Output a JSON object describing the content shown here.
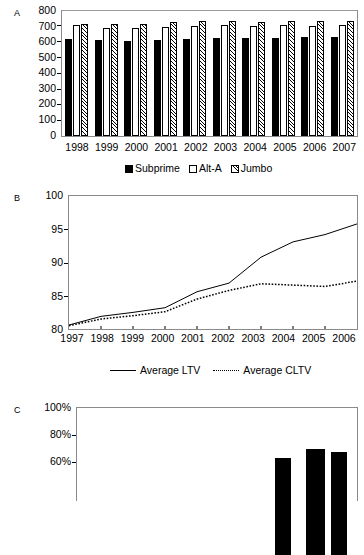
{
  "figure": {
    "panels": [
      {
        "letter": "A"
      },
      {
        "letter": "B"
      },
      {
        "letter": "C"
      }
    ]
  },
  "panelA": {
    "letter": "A",
    "yticks": [
      "800",
      "700",
      "600",
      "500",
      "400",
      "300",
      "200",
      "100",
      "0"
    ],
    "xticks": [
      "1998",
      "1999",
      "2000",
      "2001",
      "2002",
      "2003",
      "2004",
      "2005",
      "2006",
      "2007"
    ],
    "legend": [
      {
        "label": "Subprime",
        "swatch": "solid-square-icon"
      },
      {
        "label": "Alt-A",
        "swatch": "open-square-icon"
      },
      {
        "label": "Jumbo",
        "swatch": "hatched-square-icon"
      }
    ]
  },
  "panelB": {
    "letter": "B",
    "yticks": [
      "100",
      "95",
      "90",
      "85",
      "80"
    ],
    "xticks": [
      "1997",
      "1998",
      "1999",
      "2000",
      "2001",
      "2002",
      "2003",
      "2004",
      "2005",
      "2006"
    ],
    "legend": [
      {
        "label": "Average LTV",
        "marker": "solid-line-icon"
      },
      {
        "label": "Average CLTV",
        "marker": "dotted-line-icon"
      }
    ]
  },
  "panelC": {
    "letter": "C",
    "yticks": [
      "100%",
      "80%",
      "60%"
    ]
  },
  "chart_data": [
    {
      "type": "bar",
      "panel": "A",
      "title": "",
      "xlabel": "",
      "ylabel": "",
      "ylim": [
        0,
        800
      ],
      "ytick_values": [
        0,
        100,
        200,
        300,
        400,
        500,
        600,
        700,
        800
      ],
      "grid": false,
      "legend_position": "bottom",
      "categories": [
        "1998",
        "1999",
        "2000",
        "2001",
        "2002",
        "2003",
        "2004",
        "2005",
        "2006",
        "2007"
      ],
      "series": [
        {
          "name": "Subprime",
          "style": "solid-black",
          "values": [
            619,
            613,
            609,
            616,
            621,
            625,
            625,
            629,
            634,
            634
          ]
        },
        {
          "name": "Alt-A",
          "style": "open-white",
          "values": [
            708,
            692,
            692,
            697,
            704,
            710,
            707,
            710,
            705,
            711
          ]
        },
        {
          "name": "Jumbo",
          "style": "hatched",
          "values": [
            720,
            716,
            719,
            727,
            733,
            733,
            729,
            734,
            735,
            737
          ]
        }
      ]
    },
    {
      "type": "line",
      "panel": "B",
      "title": "",
      "xlabel": "",
      "ylabel": "",
      "ylim": [
        80,
        100
      ],
      "ytick_values": [
        80,
        85,
        90,
        95,
        100
      ],
      "grid": false,
      "legend_position": "bottom",
      "x": [
        "1997",
        "1998",
        "1999",
        "2000",
        "2001",
        "2002",
        "2003",
        "2004",
        "2005",
        "2006"
      ],
      "series": [
        {
          "name": "Average LTV",
          "style": "solid",
          "values": [
            80.6,
            81.9,
            82.5,
            83.2,
            85.6,
            86.9,
            90.8,
            93.1,
            94.2,
            95.8
          ]
        },
        {
          "name": "Average CLTV",
          "style": "dotted",
          "values": [
            80.5,
            81.5,
            82.0,
            82.6,
            84.5,
            85.8,
            86.8,
            86.6,
            86.4,
            87.2
          ]
        }
      ]
    },
    {
      "type": "bar",
      "panel": "C",
      "title": "",
      "xlabel": "",
      "ylabel": "",
      "ylim": [
        0,
        100
      ],
      "ytick_values": [
        60,
        80,
        100
      ],
      "ytick_labels": [
        "60%",
        "80%",
        "100%"
      ],
      "grid": false,
      "note": "Panel C is cropped by the bottom edge of the screenshot; only three bars near the right side are partially visible.",
      "categories": [
        "",
        "",
        ""
      ],
      "values": [
        46,
        55,
        52
      ]
    }
  ]
}
